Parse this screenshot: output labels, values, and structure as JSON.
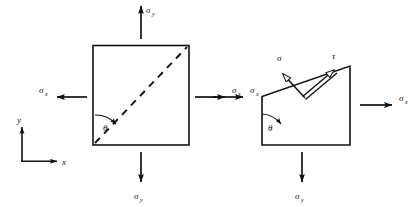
{
  "figure": {
    "title": "",
    "background_color": "#ffffff",
    "line_color": "#111111",
    "panels": [
      {
        "name": "square-element",
        "shape": "square",
        "labels": {
          "sigma_y_top": "σ",
          "sigma_y_top_sub": "y",
          "sigma_y_bottom": "σ",
          "sigma_y_bottom_sub": "y",
          "sigma_x_left": "σ",
          "sigma_x_left_sub": "x",
          "sigma_x_right": "σ",
          "sigma_x_right_sub": "x",
          "theta": "θ"
        },
        "diagonal_style": "dashed"
      },
      {
        "name": "triangle-element",
        "shape": "right-triangle",
        "labels": {
          "sigma_x_left": "σ",
          "sigma_x_left_sub": "x",
          "sigma_x_right": "σ",
          "sigma_x_right_sub": "x",
          "sigma_y_bottom": "σ",
          "sigma_y_bottom_sub": "y",
          "sigma_normal": "σ",
          "tau_shear": "τ",
          "theta": "θ"
        },
        "diagonal_style": "solid"
      }
    ],
    "axes": {
      "name": "coordinate-axes",
      "y_label": "y",
      "x_label": "x"
    }
  }
}
